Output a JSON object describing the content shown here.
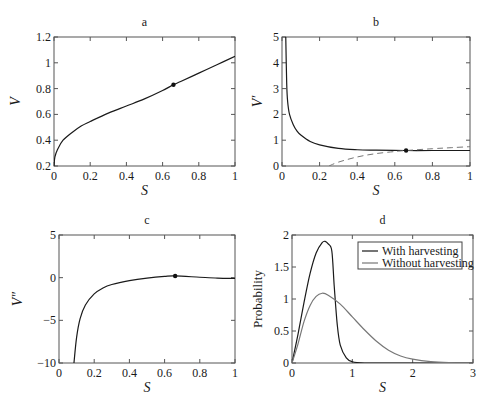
{
  "chart_data": [
    {
      "panel": "a",
      "type": "line",
      "title": "a",
      "xlabel": "S",
      "ylabel": "V",
      "xlim": [
        0,
        1
      ],
      "ylim": [
        0.2,
        1.2
      ],
      "xticks": [
        "0",
        "0.2",
        "0.4",
        "0.6",
        "0.8",
        "1"
      ],
      "yticks": [
        "0.2",
        "0.4",
        "0.6",
        "0.8",
        "1",
        "1.2"
      ],
      "grid": false,
      "series": [
        {
          "name": "V",
          "style": "solid",
          "color": "#1a1a1a",
          "x": [
            0,
            0.005,
            0.02,
            0.05,
            0.1,
            0.15,
            0.2,
            0.3,
            0.4,
            0.5,
            0.6,
            0.66,
            0.7,
            0.8,
            0.9,
            1.0
          ],
          "y": [
            0.2,
            0.27,
            0.33,
            0.4,
            0.46,
            0.51,
            0.545,
            0.61,
            0.665,
            0.72,
            0.785,
            0.83,
            0.855,
            0.92,
            0.985,
            1.05
          ]
        }
      ],
      "markers": [
        {
          "x": 0.66,
          "y": 0.83
        }
      ]
    },
    {
      "panel": "b",
      "type": "line",
      "title": "b",
      "xlabel": "S",
      "ylabel": "V′",
      "xlim": [
        0,
        1
      ],
      "ylim": [
        0,
        5
      ],
      "xticks": [
        "0",
        "0.2",
        "0.4",
        "0.6",
        "0.8",
        "1"
      ],
      "yticks": [
        "0",
        "1",
        "2",
        "3",
        "4",
        "5"
      ],
      "grid": false,
      "series": [
        {
          "name": "V′",
          "style": "solid",
          "color": "#1a1a1a",
          "x": [
            0.02,
            0.025,
            0.03,
            0.04,
            0.06,
            0.08,
            0.1,
            0.15,
            0.2,
            0.3,
            0.4,
            0.5,
            0.66,
            0.8,
            1.0
          ],
          "y": [
            5.0,
            3.2,
            2.5,
            2.0,
            1.6,
            1.35,
            1.2,
            0.95,
            0.82,
            0.68,
            0.63,
            0.615,
            0.6,
            0.6,
            0.6
          ]
        },
        {
          "name": "reference",
          "style": "dashed",
          "color": "#777777",
          "x": [
            0.25,
            0.3,
            0.4,
            0.5,
            0.6,
            0.66,
            0.8,
            0.9,
            1.0
          ],
          "y": [
            0.0,
            0.15,
            0.35,
            0.48,
            0.56,
            0.6,
            0.67,
            0.71,
            0.75
          ]
        }
      ],
      "markers": [
        {
          "x": 0.66,
          "y": 0.6
        }
      ]
    },
    {
      "panel": "c",
      "type": "line",
      "title": "c",
      "xlabel": "S",
      "ylabel": "V″",
      "xlim": [
        0,
        1
      ],
      "ylim": [
        -10,
        5
      ],
      "xticks": [
        "0",
        "0.2",
        "0.4",
        "0.6",
        "0.8",
        "1"
      ],
      "yticks": [
        "-10",
        "-5",
        "0",
        "5"
      ],
      "grid": false,
      "series": [
        {
          "name": "V″",
          "style": "solid",
          "color": "#1a1a1a",
          "x": [
            0.085,
            0.1,
            0.12,
            0.15,
            0.2,
            0.25,
            0.3,
            0.4,
            0.5,
            0.6,
            0.66,
            0.8,
            0.9,
            1.0
          ],
          "y": [
            -10,
            -7.0,
            -4.8,
            -3.2,
            -1.9,
            -1.2,
            -0.8,
            -0.35,
            -0.05,
            0.15,
            0.2,
            0.05,
            -0.05,
            -0.1
          ]
        }
      ],
      "markers": [
        {
          "x": 0.66,
          "y": 0.2
        }
      ]
    },
    {
      "panel": "d",
      "type": "line",
      "title": "d",
      "xlabel": "S",
      "ylabel": "Probability",
      "xlim": [
        0,
        3
      ],
      "ylim": [
        0,
        2
      ],
      "xticks": [
        "0",
        "1",
        "2",
        "3"
      ],
      "yticks": [
        "0",
        "0.5",
        "1",
        "1.5",
        "2"
      ],
      "grid": false,
      "legend_position": "upper right",
      "series": [
        {
          "name": "With harvesting",
          "style": "solid",
          "color": "#1a1a1a",
          "x": [
            0,
            0.1,
            0.2,
            0.3,
            0.4,
            0.5,
            0.55,
            0.6,
            0.66,
            0.7,
            0.75,
            0.8,
            0.9,
            1.0,
            1.2,
            1.5,
            3.0
          ],
          "y": [
            0,
            0.45,
            0.95,
            1.4,
            1.72,
            1.88,
            1.9,
            1.86,
            1.75,
            1.2,
            0.6,
            0.28,
            0.08,
            0.02,
            0.0,
            0.0,
            0.0
          ]
        },
        {
          "name": "Without harvesting",
          "style": "solid",
          "color": "#777777",
          "x": [
            0,
            0.1,
            0.2,
            0.3,
            0.4,
            0.5,
            0.6,
            0.8,
            1.0,
            1.2,
            1.4,
            1.6,
            1.8,
            2.0,
            2.3,
            2.6,
            3.0
          ],
          "y": [
            0,
            0.3,
            0.65,
            0.9,
            1.04,
            1.09,
            1.06,
            0.92,
            0.72,
            0.52,
            0.34,
            0.2,
            0.11,
            0.06,
            0.02,
            0.005,
            0.0
          ]
        }
      ]
    }
  ],
  "panels": {
    "a": {
      "title": "a",
      "xlabel": "S",
      "ylabel": "V"
    },
    "b": {
      "title": "b",
      "xlabel": "S",
      "ylabel": "V′"
    },
    "c": {
      "title": "c",
      "xlabel": "S",
      "ylabel": "V″"
    },
    "d": {
      "title": "d",
      "xlabel": "S",
      "ylabel": "Probability",
      "legend": [
        "With harvesting",
        "Without harvesting"
      ]
    }
  }
}
